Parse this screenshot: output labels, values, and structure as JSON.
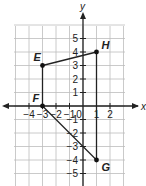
{
  "diagram": {
    "type": "coordinate-plane",
    "x_axis_label": "x",
    "y_axis_label": "y",
    "x_range": [
      -5,
      3
    ],
    "y_range": [
      -6,
      6
    ],
    "x_tick_labels": [
      {
        "value": -4,
        "label": "−4"
      },
      {
        "value": -3,
        "label": "−3"
      },
      {
        "value": -2,
        "label": "−2"
      },
      {
        "value": -1,
        "label": "−1"
      },
      {
        "value": 2,
        "label": "2"
      }
    ],
    "origin_label": "0",
    "x_tick_label_1": "1",
    "y_tick_labels": [
      {
        "value": 5,
        "label": "5"
      },
      {
        "value": 4,
        "label": "4"
      },
      {
        "value": 3,
        "label": "3"
      },
      {
        "value": 2,
        "label": "2"
      },
      {
        "value": 1,
        "label": "1"
      },
      {
        "value": -1,
        "label": "−1"
      },
      {
        "value": -2,
        "label": "−2"
      },
      {
        "value": -3,
        "label": "−3"
      },
      {
        "value": -4,
        "label": "−4"
      },
      {
        "value": -5,
        "label": "−5"
      }
    ],
    "points": [
      {
        "name": "E",
        "x": -3,
        "y": 3
      },
      {
        "name": "H",
        "x": 1,
        "y": 4
      },
      {
        "name": "F",
        "x": -3,
        "y": 0
      },
      {
        "name": "G",
        "x": 1,
        "y": -4
      }
    ],
    "segments": [
      [
        "E",
        "H"
      ],
      [
        "E",
        "F"
      ],
      [
        "H",
        "G"
      ],
      [
        "F",
        "G"
      ]
    ],
    "colors": {
      "grid": "#bdbdbd",
      "ink": "#222222"
    }
  }
}
